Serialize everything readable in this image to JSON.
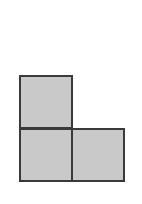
{
  "diagram": {
    "type": "polyomino",
    "shape": "L-tromino",
    "cell_count": 3,
    "colors": {
      "fill": "#c9c9c9",
      "stroke": "#3a3a3a",
      "background": "#ffffff"
    },
    "cells": [
      {
        "id": "top-left",
        "row": 0,
        "col": 0,
        "left": 19,
        "top": 75
      },
      {
        "id": "bottom-left",
        "row": 1,
        "col": 0,
        "left": 19,
        "top": 128
      },
      {
        "id": "bottom-right",
        "row": 1,
        "col": 1,
        "left": 71,
        "top": 128
      }
    ]
  }
}
